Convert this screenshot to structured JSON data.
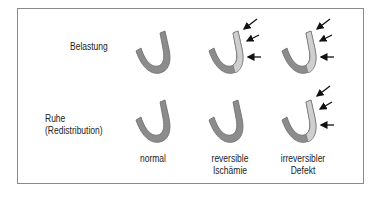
{
  "diagram": {
    "rows": [
      {
        "label_line1": "Belastung",
        "label_line2": ""
      },
      {
        "label_line1": "Ruhe",
        "label_line2": "(Redistribution)"
      }
    ],
    "columns": [
      {
        "label_line1": "normal",
        "label_line2": ""
      },
      {
        "label_line1": "reversible",
        "label_line2": "Ischämie"
      },
      {
        "label_line1": "irreversibler",
        "label_line2": "Defekt"
      }
    ],
    "cells": [
      {
        "row": 0,
        "col": 0,
        "defect": false,
        "arrows": 0
      },
      {
        "row": 0,
        "col": 1,
        "defect": true,
        "arrows": 3
      },
      {
        "row": 0,
        "col": 2,
        "defect": true,
        "arrows": 3
      },
      {
        "row": 1,
        "col": 0,
        "defect": false,
        "arrows": 0
      },
      {
        "row": 1,
        "col": 1,
        "defect": false,
        "arrows": 0
      },
      {
        "row": 1,
        "col": 2,
        "defect": true,
        "arrows": 3
      }
    ],
    "colors": {
      "normal_wall": "#8c8c8c",
      "defect_wall": "#cfcfcf",
      "outline": "#6a6a6a",
      "arrow": "#111111",
      "border": "#8a8a8a"
    }
  }
}
